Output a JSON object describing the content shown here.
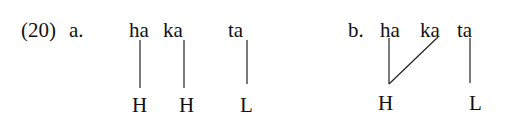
{
  "example": {
    "number": "(20)",
    "a": {
      "label": "a.",
      "syllables": [
        "ha",
        "ka",
        "ta"
      ],
      "tones": [
        "H",
        "H",
        "L"
      ],
      "associations": [
        [
          0,
          0
        ],
        [
          1,
          1
        ],
        [
          2,
          2
        ]
      ]
    },
    "b": {
      "label": "b.",
      "syllables": [
        "ha",
        "ka",
        "ta"
      ],
      "tones": [
        "H",
        "L"
      ],
      "associations": [
        [
          0,
          0
        ],
        [
          1,
          0
        ],
        [
          2,
          1
        ]
      ]
    }
  }
}
